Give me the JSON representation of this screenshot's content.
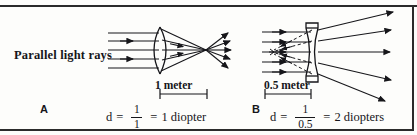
{
  "figure": {
    "background_color": "#fdfdfb",
    "ink_color": "#16161a",
    "width": 417,
    "height": 135
  },
  "panel_a": {
    "letter": "A",
    "rays_label": "Parallel light rays",
    "lens_type": "convex",
    "measurement_label": "1 meter",
    "equation": {
      "variable": "d",
      "equals_1": "=",
      "numerator": "1",
      "denominator": "1",
      "equals_2": "=",
      "result": "1 diopter"
    }
  },
  "panel_b": {
    "letter": "B",
    "lens_type": "concave",
    "measurement_label": "0.5 meter",
    "equation": {
      "variable": "d",
      "equals_1": "=",
      "numerator": "1",
      "denominator": "0.5",
      "equals_2": "=",
      "result": "2 diopters"
    }
  }
}
